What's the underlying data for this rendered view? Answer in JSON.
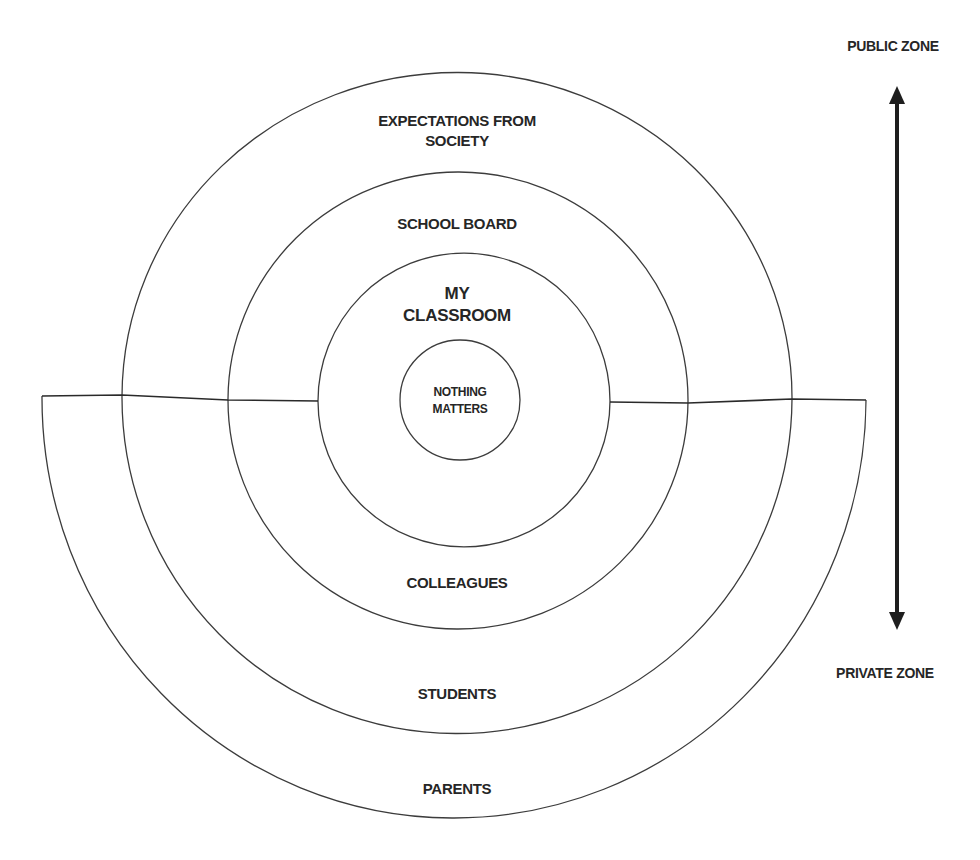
{
  "diagram": {
    "type": "concentric-zones",
    "upper_rings": [
      {
        "id": "society",
        "label_line1": "EXPECTATIONS FROM",
        "label_line2": "SOCIETY"
      },
      {
        "id": "school_board",
        "label": "SCHOOL BOARD"
      },
      {
        "id": "my_classroom",
        "label_line1": "MY",
        "label_line2": "CLASSROOM"
      }
    ],
    "core": {
      "label_line1": "NOTHING",
      "label_line2": "MATTERS"
    },
    "lower_rings": [
      {
        "id": "colleagues",
        "label": "COLLEAGUES"
      },
      {
        "id": "students",
        "label": "STUDENTS"
      },
      {
        "id": "parents",
        "label": "PARENTS"
      }
    ],
    "axis": {
      "top_label": "PUBLIC ZONE",
      "bottom_label": "PRIVATE ZONE",
      "arrow": "double-headed-vertical"
    },
    "colors": {
      "line": "#3c3c3c",
      "text": "#262626",
      "arrow": "#1e1e1e",
      "background": "#ffffff"
    }
  }
}
